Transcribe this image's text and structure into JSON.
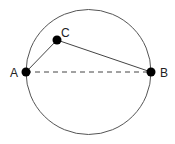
{
  "diagram": {
    "title": "",
    "circle": {
      "cx": 88.5,
      "cy": 72,
      "r": 62.5,
      "stroke": "#555555"
    },
    "points": [
      {
        "id": "A",
        "label": "A",
        "x": 26,
        "y": 72,
        "label_x": 10,
        "label_y": 77
      },
      {
        "id": "B",
        "label": "B",
        "x": 151,
        "y": 72,
        "label_x": 160,
        "label_y": 77
      },
      {
        "id": "C",
        "label": "C",
        "x": 57,
        "y": 40,
        "label_x": 61,
        "label_y": 37
      }
    ],
    "segments": [
      {
        "from": "A",
        "to": "C",
        "style": "solid"
      },
      {
        "from": "C",
        "to": "B",
        "style": "solid"
      },
      {
        "from": "A",
        "to": "B",
        "style": "dashed",
        "note": "diameter"
      }
    ],
    "colors": {
      "point_fill": "#000000",
      "line": "#444444",
      "dashed_line": "#444444",
      "label": "#222222"
    }
  }
}
